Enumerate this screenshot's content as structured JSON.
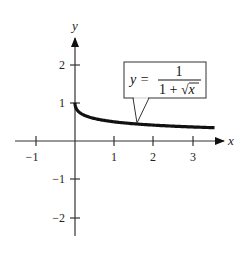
{
  "chart_data": {
    "type": "line",
    "title": "",
    "xlabel": "x",
    "ylabel": "y",
    "xlim": [
      -1.5,
      3.8
    ],
    "ylim": [
      -2.5,
      2.7
    ],
    "grid": false,
    "x_ticks": [
      -1,
      1,
      2,
      3
    ],
    "y_ticks": [
      2,
      1,
      -1,
      -2
    ],
    "x_tick_labels": [
      "−1",
      "1",
      "2",
      "3"
    ],
    "y_tick_labels": [
      "2",
      "1",
      "−1",
      "−2"
    ],
    "series": [
      {
        "name": "y = 1/(1 + √x)",
        "function": "1/(1+sqrt(x))",
        "domain": [
          0,
          3.55
        ],
        "x": [
          0,
          0.05,
          0.25,
          0.5,
          1,
          1.5,
          2,
          2.5,
          3,
          3.55
        ],
        "values": [
          1,
          0.817,
          0.667,
          0.586,
          0.5,
          0.45,
          0.414,
          0.387,
          0.366,
          0.347
        ]
      }
    ],
    "annotations": [
      {
        "text": "y = 1/(1 + √x)",
        "lhs": "y =",
        "numerator": "1",
        "denominator_prefix": "1 + ",
        "denominator_radical": "x",
        "points_to": [
          1.6,
          0.45
        ]
      }
    ]
  }
}
